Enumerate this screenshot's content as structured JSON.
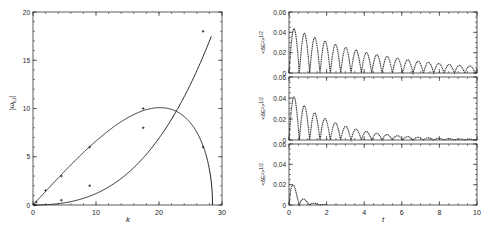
{
  "chart_data": [
    {
      "type": "line",
      "panel": "left",
      "title": "",
      "xlabel": "k",
      "ylabel": "|ω_k,i|",
      "xlim": [
        0,
        30
      ],
      "ylim": [
        0,
        20
      ],
      "xticks": [
        0,
        10,
        20,
        30
      ],
      "yticks": [
        0,
        5,
        10,
        15,
        20
      ],
      "grid": false,
      "series": [
        {
          "name": "growing curve",
          "x": [
            0,
            0.3,
            4.5,
            9,
            17.5,
            27,
            28.3
          ],
          "y": [
            0,
            0,
            0.5,
            2,
            8,
            18,
            20
          ],
          "markers_x": [
            0.3,
            4.5,
            9,
            17.5,
            27
          ],
          "markers_y": [
            0,
            0.5,
            2,
            8,
            18
          ]
        },
        {
          "name": "arch curve",
          "x": [
            0,
            0.5,
            2,
            4.5,
            9,
            17.5,
            20,
            24,
            27,
            28.3,
            28.5
          ],
          "y": [
            0,
            0.3,
            1.5,
            3,
            6,
            10,
            10.1,
            9,
            6,
            2,
            0
          ],
          "markers_x": [
            0.5,
            2,
            4.5,
            9,
            17.5,
            27
          ],
          "markers_y": [
            0.3,
            1.5,
            3,
            6,
            10,
            6
          ]
        }
      ]
    },
    {
      "type": "line",
      "panel": "right-top",
      "xlabel": "",
      "ylabel": "<δE²>^1/2",
      "xlim": [
        0,
        10
      ],
      "ylim": [
        0,
        0.06
      ],
      "yticks": [
        0,
        0.02,
        0.04,
        0.06
      ],
      "ytick_labels": [
        "0",
        "0.02",
        "0.04",
        "0.06"
      ],
      "series": [
        {
          "name": "oscillation envelope",
          "peak_initial": 0.046,
          "peak_final": 0.007,
          "decay_rate": 0.2,
          "period": 0.55,
          "t_end": 10
        }
      ]
    },
    {
      "type": "line",
      "panel": "right-middle",
      "xlabel": "",
      "ylabel": "<δE²>^1/2",
      "xlim": [
        0,
        10
      ],
      "ylim": [
        0,
        0.06
      ],
      "yticks": [
        0,
        0.02,
        0.04,
        0.06
      ],
      "ytick_labels": [
        "0",
        "0.02",
        "0.04",
        "0.06"
      ],
      "series": [
        {
          "name": "oscillation envelope",
          "peak_initial": 0.046,
          "peak_final": 0.001,
          "decay_rate": 0.42,
          "period": 0.55,
          "t_end": 10
        }
      ]
    },
    {
      "type": "line",
      "panel": "right-bottom",
      "xlabel": "t",
      "ylabel": "<δE²>^1/2",
      "xlim": [
        0,
        10
      ],
      "ylim": [
        0,
        0.06
      ],
      "xticks": [
        0,
        2,
        4,
        6,
        8,
        10
      ],
      "yticks": [
        0,
        0.02,
        0.04,
        0.06
      ],
      "ytick_labels": [
        "0",
        "0.02",
        "0.04",
        "0.06"
      ],
      "series": [
        {
          "name": "oscillation envelope",
          "peak_initial": 0.034,
          "peak_final": 0.0,
          "decay_rate": 2.2,
          "period": 0.55,
          "t_end": 2
        }
      ]
    }
  ],
  "labels": {
    "left_xlabel": "k",
    "left_ylabel": "|ω",
    "left_ylabel_sub": "k,i",
    "right_xlabel": "t",
    "right_ylabel": "<δE²>",
    "right_ylabel_sup": "1/2"
  }
}
